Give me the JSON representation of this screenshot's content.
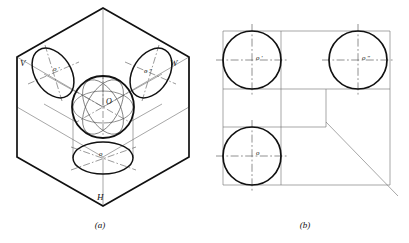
{
  "figure": {
    "captions": [
      {
        "id": "caption-a",
        "text": "(a)",
        "x": 100,
        "y": 228
      },
      {
        "id": "caption-b",
        "text": "(b)",
        "x": 305,
        "y": 228
      }
    ],
    "colors": {
      "outline": "#111111",
      "thin": "#666666",
      "center_line": "#555555",
      "background": "#ffffff",
      "label": "#111111"
    }
  },
  "panel_a": {
    "name": "isometric-projection-box",
    "plane_labels": [
      {
        "id": "plane-v",
        "text": "V",
        "x": 20,
        "y": 66
      },
      {
        "id": "plane-w",
        "text": "W",
        "x": 170,
        "y": 66
      },
      {
        "id": "plane-h",
        "text": "H",
        "x": 97,
        "y": 200
      }
    ],
    "point_labels": [
      {
        "id": "point-o-front",
        "text": "o ′",
        "x": 53,
        "y": 71
      },
      {
        "id": "point-o-side",
        "text": "o ″",
        "x": 144,
        "y": 73
      },
      {
        "id": "point-o-center",
        "text": "O",
        "x": 106,
        "y": 104
      },
      {
        "id": "point-o-top",
        "text": "o",
        "x": 99,
        "y": 156
      }
    ],
    "hexagon": {
      "center_x": 103,
      "center_y": 107,
      "vertices": [
        [
          103,
          8
        ],
        [
          189,
          57
        ],
        [
          189,
          157
        ],
        [
          103,
          206
        ],
        [
          17,
          157
        ],
        [
          17,
          57
        ]
      ]
    },
    "sphere": {
      "cx": 103,
      "cy": 107,
      "r": 31
    },
    "ellipses": [
      {
        "id": "ellipse-front-v",
        "cx": 53,
        "cy": 73,
        "rx": 18,
        "ry": 27,
        "rotate": -32
      },
      {
        "id": "ellipse-side-w",
        "cx": 151,
        "cy": 73,
        "rx": 18,
        "ry": 27,
        "rotate": 32
      },
      {
        "id": "ellipse-top-h",
        "cx": 103,
        "cy": 158,
        "rx": 30,
        "ry": 16,
        "rotate": 0
      }
    ]
  },
  "panel_b": {
    "name": "three-view-orthographic-projection",
    "point_labels": [
      {
        "id": "view-point-o-front",
        "text": "o ′",
        "x": 256,
        "y": 60
      },
      {
        "id": "view-point-o-side",
        "text": "o ″",
        "x": 362,
        "y": 60
      },
      {
        "id": "view-point-o-top",
        "text": "o",
        "x": 256,
        "y": 155
      }
    ],
    "circles": [
      {
        "id": "circle-front-view",
        "cx": 252,
        "cy": 60,
        "r": 29
      },
      {
        "id": "circle-side-view",
        "cx": 358,
        "cy": 60,
        "r": 29
      },
      {
        "id": "circle-top-view",
        "cx": 252,
        "cy": 156,
        "r": 29
      }
    ],
    "box": {
      "left": 223,
      "right": 390,
      "top": 31,
      "bottom": 185
    },
    "mitre_line": {
      "x1": 326,
      "y1": 122,
      "x2": 398,
      "y2": 196
    }
  }
}
